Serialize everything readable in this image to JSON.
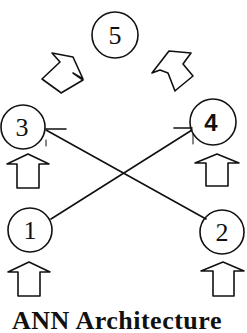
{
  "diagram": {
    "caption": "ANN Architecture",
    "nodes": [
      {
        "id": "1",
        "label": "1",
        "cx": 30,
        "cy": 230,
        "r": 22
      },
      {
        "id": "2",
        "label": "2",
        "cx": 222,
        "cy": 232,
        "r": 22
      },
      {
        "id": "3",
        "label": "3",
        "cx": 23,
        "cy": 127,
        "r": 22
      },
      {
        "id": "4",
        "label": "4",
        "cx": 213,
        "cy": 122,
        "r": 23
      },
      {
        "id": "5",
        "label": "5",
        "cx": 115,
        "cy": 35,
        "r": 23
      }
    ],
    "edges": [
      {
        "from": "3",
        "to": "2"
      },
      {
        "from": "1",
        "to": "4"
      }
    ],
    "arrows": [
      {
        "name": "input-arrow-1",
        "direction": "up"
      },
      {
        "name": "input-arrow-2",
        "direction": "up"
      },
      {
        "name": "arrow-1-to-3",
        "direction": "up"
      },
      {
        "name": "arrow-2-to-4",
        "direction": "up"
      },
      {
        "name": "arrow-3-to-5",
        "direction": "up-right"
      },
      {
        "name": "arrow-4-to-5",
        "direction": "up-left"
      }
    ],
    "colors": {
      "ink": "#111111",
      "background": "#ffffff"
    }
  }
}
